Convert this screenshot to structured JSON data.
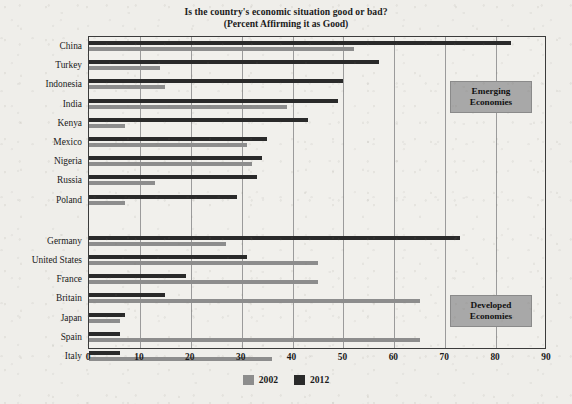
{
  "chart_data": {
    "type": "bar",
    "orientation": "horizontal",
    "title": "Is the country's economic situation good or bad?",
    "subtitle": "(Percent Affirming it as Good)",
    "xlabel": "",
    "ylabel": "",
    "xlim": [
      0,
      90
    ],
    "xticks": [
      0,
      10,
      20,
      30,
      40,
      50,
      60,
      70,
      80,
      90
    ],
    "grid": true,
    "grid_axis": "x",
    "legend_position": "bottom-center",
    "categories": [
      "China",
      "Turkey",
      "Indonesia",
      "India",
      "Kenya",
      "Mexico",
      "Nigeria",
      "Russia",
      "Poland",
      "Germany",
      "United States",
      "France",
      "Britain",
      "Japan",
      "Spain",
      "Italy"
    ],
    "series": [
      {
        "name": "2002",
        "color": "#8d8d8d",
        "values": [
          52,
          14,
          15,
          39,
          7,
          31,
          32,
          13,
          7,
          27,
          45,
          45,
          65,
          6,
          65,
          36
        ]
      },
      {
        "name": "2012",
        "color": "#2a2a2a",
        "values": [
          83,
          57,
          50,
          49,
          43,
          35,
          34,
          33,
          29,
          73,
          31,
          19,
          15,
          7,
          6,
          6
        ]
      }
    ],
    "groups": [
      {
        "label": "Emerging\nEconomies",
        "label_line1": "Emerging",
        "label_line2": "Economies",
        "members": [
          "China",
          "Turkey",
          "Indonesia",
          "India",
          "Kenya",
          "Mexico",
          "Nigeria",
          "Russia",
          "Poland"
        ]
      },
      {
        "label": "Developed\nEconomies",
        "label_line1": "Developed",
        "label_line2": "Economies",
        "members": [
          "Germany",
          "United States",
          "France",
          "Britain",
          "Japan",
          "Spain",
          "Italy"
        ]
      }
    ],
    "annotations": [
      {
        "name": "emerging-economies-box",
        "line1": "Emerging",
        "line2": "Economies"
      },
      {
        "name": "developed-economies-box",
        "line1": "Developed",
        "line2": "Economies"
      }
    ]
  },
  "legend": {
    "items": [
      {
        "label": "2002",
        "color": "#8d8d8d"
      },
      {
        "label": "2012",
        "color": "#2a2a2a"
      }
    ]
  },
  "colors": {
    "series_2002": "#8d8d8d",
    "series_2012": "#2a2a2a",
    "group_box": "#a8a8a8",
    "background": "#efeeea",
    "frame": "#3b3b3b",
    "gridline": "#9b9b9b"
  }
}
